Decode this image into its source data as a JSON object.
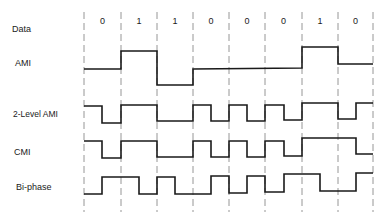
{
  "labels": {
    "data": "Data",
    "ami": "AMI",
    "two_level_ami": "2-Level AMI",
    "cmi": "CMI",
    "biphase": "Bi-phase"
  },
  "bits": [
    "0",
    "1",
    "1",
    "0",
    "0",
    "0",
    "1",
    "0"
  ],
  "grid_x": [
    84,
    121,
    157,
    193,
    229,
    265,
    302,
    338,
    373
  ],
  "colors": {
    "line": "#1a1a1a",
    "grid": "#8a8a8a"
  },
  "waveforms": {
    "ami": "84,69 121,69 121,51 157,51 157,85 193,85 193,69 302,68 302,47 338,47 338,64 373,64",
    "two_level_ami": "84,106 102,106 102,123 121,123 121,105 157,105 157,121 193,121 193,105 211,105 211,121 229,121 229,105 247,105 247,121 265,121 265,105 284,105 284,120 302,120 302,103 338,103 338,119 356,119 356,103 373,103",
    "cmi": "84,141 102,141 102,158 121,158 121,141 157,141 157,157 193,157 193,141 211,141 211,157 229,157 229,141 247,141 247,157 265,157 265,141 284,141 284,156 302,156 302,138 356,138 356,154 373,154",
    "biphase": "84,194 102,194 102,177 139,177 139,194 157,194 157,177 175,177 175,194 211,194 211,176 229,176 229,193 247,193 247,176 265,176 265,192 284,192 284,174 320,174 320,191 356,191 356,173 373,173"
  }
}
